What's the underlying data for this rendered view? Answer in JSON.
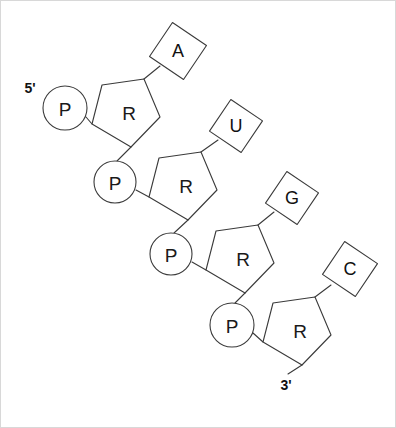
{
  "figure": {
    "canvas": {
      "width": 396,
      "height": 428,
      "background": "#ffffff",
      "border_color": "#d8d8d8"
    },
    "stroke_color": "#3a3a3a",
    "text_color": "#111111"
  },
  "terminals": {
    "five_prime": {
      "label": "5'",
      "x": 30,
      "y": 88
    },
    "three_prime": {
      "label": "3'",
      "x": 286,
      "y": 385
    }
  },
  "phosphates": [
    {
      "label": "P",
      "cx": 65,
      "cy": 108,
      "r": 22
    },
    {
      "label": "P",
      "cx": 115,
      "cy": 182,
      "r": 21
    },
    {
      "label": "P",
      "cx": 171,
      "cy": 254,
      "r": 21
    },
    {
      "label": "P",
      "cx": 232,
      "cy": 325,
      "r": 22
    }
  ],
  "riboses": [
    {
      "label": "R",
      "cx": 129,
      "cy": 113,
      "points": "102,85 144,79 160,117 131,147 92,124"
    },
    {
      "label": "R",
      "cx": 186,
      "cy": 186,
      "points": "159,158 201,152 217,190 188,220 149,197"
    },
    {
      "label": "R",
      "cx": 243,
      "cy": 259,
      "points": "216,231 258,225 274,263 245,293 206,270"
    },
    {
      "label": "R",
      "cx": 300,
      "cy": 331,
      "points": "273,303 315,297 331,335 302,365 263,342"
    }
  ],
  "bases": [
    {
      "label": "A",
      "cx": 178,
      "cy": 51,
      "half": 29,
      "rotation": -11
    },
    {
      "label": "U",
      "cx": 236,
      "cy": 126,
      "half": 27,
      "rotation": -11
    },
    {
      "label": "G",
      "cx": 292,
      "cy": 198,
      "half": 27,
      "rotation": -11
    },
    {
      "label": "C",
      "cx": 350,
      "cy": 269,
      "half": 28,
      "rotation": -11
    }
  ],
  "bonds": [
    {
      "name": "p1-to-r1",
      "x1": 86,
      "y1": 117,
      "x2": 92,
      "y2": 124
    },
    {
      "name": "r1-to-base-a",
      "x1": 144,
      "y1": 79,
      "x2": 160,
      "y2": 66
    },
    {
      "name": "r1-to-p2",
      "x1": 131,
      "y1": 147,
      "x2": 117,
      "y2": 161
    },
    {
      "name": "p2-to-r2",
      "x1": 136,
      "y1": 190,
      "x2": 149,
      "y2": 197
    },
    {
      "name": "r2-to-base-u",
      "x1": 201,
      "y1": 152,
      "x2": 218,
      "y2": 140
    },
    {
      "name": "r2-to-p3",
      "x1": 188,
      "y1": 220,
      "x2": 174,
      "y2": 233
    },
    {
      "name": "p3-to-r3",
      "x1": 192,
      "y1": 262,
      "x2": 206,
      "y2": 270
    },
    {
      "name": "r3-to-base-g",
      "x1": 258,
      "y1": 225,
      "x2": 274,
      "y2": 212
    },
    {
      "name": "r3-to-p4",
      "x1": 245,
      "y1": 293,
      "x2": 235,
      "y2": 303
    },
    {
      "name": "p4-to-r4",
      "x1": 253,
      "y1": 333,
      "x2": 263,
      "y2": 342
    },
    {
      "name": "r4-to-base-c",
      "x1": 315,
      "y1": 297,
      "x2": 331,
      "y2": 285
    },
    {
      "name": "r4-to-three-prime",
      "x1": 302,
      "y1": 365,
      "x2": 288,
      "y2": 374
    }
  ],
  "legend_keys": {
    "phosphate": "P",
    "ribose": "R",
    "adenine": "A",
    "uracil": "U",
    "guanine": "G",
    "cytosine": "C"
  }
}
